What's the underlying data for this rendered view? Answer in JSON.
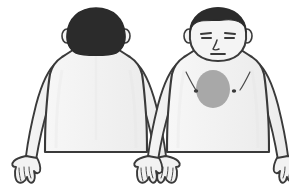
{
  "diagram": {
    "canvas": {
      "width": 289,
      "height": 191,
      "background": "#ffffff"
    },
    "figures": [
      {
        "id": "posterior-figure",
        "view_label": "Posterior view",
        "description": "Back view of male upper body, head and hair seen from behind, arms at sides, hands open",
        "center_x": 96,
        "parts": [
          {
            "name": "hair",
            "label": "Hair"
          },
          {
            "name": "ear-left",
            "label": "Left ear"
          },
          {
            "name": "ear-right",
            "label": "Right ear"
          },
          {
            "name": "neck",
            "label": "Neck"
          },
          {
            "name": "torso",
            "label": "Back / torso"
          },
          {
            "name": "spine-line",
            "label": "Spine midline"
          },
          {
            "name": "arm-left",
            "label": "Left arm"
          },
          {
            "name": "arm-right",
            "label": "Right arm"
          },
          {
            "name": "hand-left",
            "label": "Left hand"
          },
          {
            "name": "hand-right",
            "label": "Right hand"
          }
        ],
        "highlights": []
      },
      {
        "id": "anterior-figure",
        "view_label": "Anterior view",
        "description": "Front view of male upper body with face, arms at sides, hands open, shaded oval marking on the chest",
        "center_x": 218,
        "parts": [
          {
            "name": "hair",
            "label": "Hair"
          },
          {
            "name": "face",
            "label": "Face"
          },
          {
            "name": "eyebrow-left",
            "label": "Left eyebrow"
          },
          {
            "name": "eyebrow-right",
            "label": "Right eyebrow"
          },
          {
            "name": "eye-left",
            "label": "Left eye"
          },
          {
            "name": "eye-right",
            "label": "Right eye"
          },
          {
            "name": "nose",
            "label": "Nose"
          },
          {
            "name": "mouth",
            "label": "Mouth"
          },
          {
            "name": "ear-left",
            "label": "Left ear"
          },
          {
            "name": "ear-right",
            "label": "Right ear"
          },
          {
            "name": "neck",
            "label": "Neck"
          },
          {
            "name": "torso",
            "label": "Chest / torso"
          },
          {
            "name": "pectoral-left",
            "label": "Left pectoral crease"
          },
          {
            "name": "pectoral-right",
            "label": "Right pectoral crease"
          },
          {
            "name": "nipple-left",
            "label": "Left nipple"
          },
          {
            "name": "nipple-right",
            "label": "Right nipple"
          },
          {
            "name": "arm-left",
            "label": "Left arm"
          },
          {
            "name": "arm-right",
            "label": "Right arm"
          },
          {
            "name": "hand-left",
            "label": "Left hand"
          },
          {
            "name": "hand-right",
            "label": "Right hand"
          }
        ],
        "highlights": [
          {
            "name": "chest-pain-region",
            "label": "Chest pain region",
            "shape": "ellipse",
            "cx": 213,
            "cy": 89,
            "rx": 17,
            "ry": 19,
            "color": "#a8a8a8",
            "opacity": 1
          }
        ]
      }
    ]
  },
  "colors": {
    "skin_fill": "#f4f4f4",
    "outline": "#3a3a3a",
    "hair": "#2b2b2b",
    "highlight": "#a8a8a8",
    "detail_line": "#4a4a4a",
    "background": "#ffffff"
  }
}
